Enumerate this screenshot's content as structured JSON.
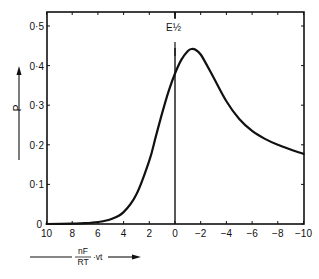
{
  "chart_data": {
    "type": "line",
    "title": "",
    "xlabel": "nF/RT · vt",
    "xlabel_parts": {
      "numerator": "nF",
      "denominator": "RT",
      "suffix": "·vt"
    },
    "ylabel": "P",
    "xlim": [
      10,
      -10
    ],
    "ylim": [
      0,
      0.52
    ],
    "x_ticks": [
      10,
      8,
      6,
      4,
      2,
      0,
      -2,
      -4,
      -6,
      -8,
      -10
    ],
    "x_tick_labels": [
      "10",
      "8",
      "6",
      "4",
      "2",
      "0",
      "−2",
      "−4",
      "−6",
      "−8",
      "−10"
    ],
    "y_ticks": [
      0,
      0.1,
      0.2,
      0.3,
      0.4,
      0.5
    ],
    "y_tick_labels": [
      "0",
      "0·1",
      "0·2",
      "0·3",
      "0·4",
      "0·5"
    ],
    "annotations": [
      {
        "text": "E½",
        "x": 0,
        "description": "vertical line at half-wave potential"
      }
    ],
    "grid": false,
    "legend": null,
    "series": [
      {
        "name": "P",
        "x": [
          10,
          8,
          7,
          6,
          5,
          4,
          3,
          2,
          1.5,
          1,
          0.5,
          0,
          -0.5,
          -1,
          -1.3,
          -1.6,
          -2,
          -2.5,
          -3,
          -4,
          -5,
          -6,
          -7,
          -8,
          -9,
          -10
        ],
        "y": [
          0.0,
          0.001,
          0.002,
          0.005,
          0.012,
          0.03,
          0.075,
          0.16,
          0.22,
          0.28,
          0.335,
          0.38,
          0.415,
          0.437,
          0.442,
          0.44,
          0.428,
          0.4,
          0.37,
          0.31,
          0.265,
          0.235,
          0.215,
          0.2,
          0.188,
          0.177
        ]
      }
    ]
  }
}
